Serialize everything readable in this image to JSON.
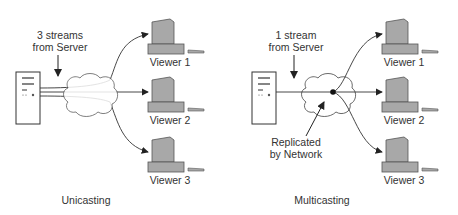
{
  "left": {
    "caption": "Unicasting",
    "stream_label_1": "3 streams",
    "stream_label_2": "from Server",
    "viewers": [
      "Viewer 1",
      "Viewer 2",
      "Viewer 3"
    ]
  },
  "right": {
    "caption": "Multicasting",
    "stream_label_1": "1 stream",
    "stream_label_2": "from Server",
    "replicated_1": "Replicated",
    "replicated_2": "by Network",
    "viewers": [
      "Viewer 1",
      "Viewer 2",
      "Viewer 3"
    ]
  },
  "colors": {
    "line": "#333333",
    "computer": "#a8a8a8",
    "computer_edge": "#555555"
  }
}
